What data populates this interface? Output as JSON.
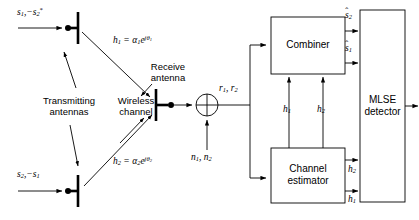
{
  "figure": {
    "type": "block-diagram",
    "background_color": "#ffffff",
    "line_color": "#000000",
    "text_color": "#000000"
  },
  "transmit": {
    "top_source_label": "s₁, −s₂*",
    "bottom_source_label": "s₂, −s₁",
    "antennas_label_line1": "Transmitting",
    "antennas_label_line2": "antennas",
    "channel_label_line1": "Wireless",
    "channel_label_line2": "channel"
  },
  "channels": {
    "h1_label": "h₁ = α₁e^{jθ₁}",
    "h2_label": "h₂ = α₂e^{jθ₂}"
  },
  "receive": {
    "antenna_label_line1": "Receive",
    "antenna_label_line2": "antenna",
    "received_signal_label": "r₁, r₂",
    "noise_label": "n₁, n₂",
    "summing_junction": "sum"
  },
  "blocks": {
    "combiner": "Combiner",
    "channel_estimator_line1": "Channel",
    "channel_estimator_line2": "estimator",
    "mlse_line1": "MLSE",
    "mlse_line2": "detector"
  },
  "signals": {
    "combiner_out_top": "ŝ₂",
    "combiner_out_bottom": "ŝ₁",
    "estimator_to_combiner_left": "h₁",
    "estimator_to_combiner_right": "h₂",
    "estimator_to_mlse_top": "h₂",
    "estimator_to_mlse_bottom": "h₁"
  }
}
